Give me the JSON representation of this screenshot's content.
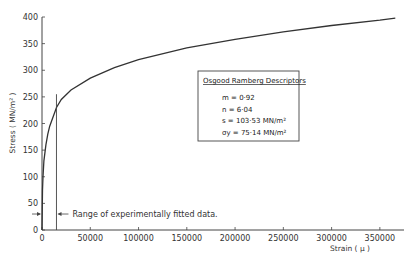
{
  "chart_data": {
    "type": "line",
    "title": "",
    "xlabel": "Strain  ( µ )",
    "ylabel": "Stress  ( MN/m² )",
    "xlim": [
      0,
      375000
    ],
    "ylim": [
      0,
      400
    ],
    "x_ticks": [
      0,
      50000,
      100000,
      150000,
      200000,
      250000,
      300000,
      350000
    ],
    "x_tick_labels": [
      "0",
      "50000",
      "100000",
      "150000",
      "200000",
      "250000",
      "300000",
      "350000"
    ],
    "y_ticks": [
      0,
      50,
      100,
      150,
      200,
      250,
      300,
      350,
      400
    ],
    "y_tick_labels": [
      "0",
      "50",
      "100",
      "150",
      "200",
      "250",
      "300",
      "350",
      "400"
    ],
    "grid": false,
    "series": [
      {
        "name": "Osgood Ramberg fit",
        "x": [
          0,
          500,
          1000,
          2000,
          4000,
          6000,
          8000,
          10000,
          15000,
          20000,
          30000,
          50000,
          75000,
          100000,
          150000,
          200000,
          250000,
          300000,
          350000,
          366000
        ],
        "y": [
          0,
          75,
          100,
          130,
          160,
          180,
          195,
          205,
          230,
          245,
          263,
          285,
          305,
          320,
          342,
          358,
          372,
          384,
          394,
          398
        ]
      }
    ],
    "annotations": [
      {
        "type": "vline",
        "x": 15000,
        "y_top": 255,
        "label": "Range of experimentally fitted data.",
        "arrow_y": 30
      }
    ],
    "legend_box": {
      "title": "Osgood  Ramberg  Descriptors",
      "lines": [
        "m  =  0·92",
        "n  =  6·04",
        "s  =  103·53  MN/m²",
        "σy =  75·14  MN/m²"
      ]
    }
  }
}
